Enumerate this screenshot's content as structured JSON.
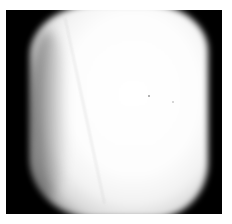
{
  "image": {
    "description": "Grayscale photograph of a bright, rounded, roughly rectangular object on a black background inside a thin white border",
    "colors": {
      "border": "#ffffff",
      "background": "#000000",
      "object": "#ffffff"
    }
  }
}
